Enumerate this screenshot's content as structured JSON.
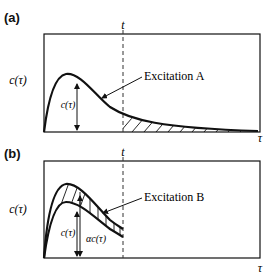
{
  "panels": [
    {
      "label": "(a)",
      "time_marker": "t",
      "y_label": "c(τ)",
      "inner_label": "c(τ)",
      "annotation": "Excitation A",
      "x_label": "τ"
    },
    {
      "label": "(b)",
      "time_marker": "t",
      "y_label": "c(τ)",
      "inner_label_1": "c(τ)",
      "inner_label_2": "αc(τ)",
      "annotation": "Excitation B",
      "x_label": "τ"
    }
  ]
}
